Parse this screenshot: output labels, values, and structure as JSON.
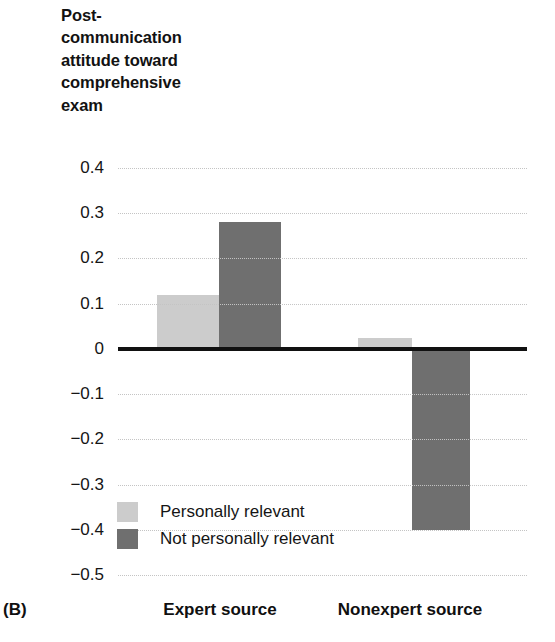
{
  "panel": {
    "label": "(B)"
  },
  "chart_data": {
    "type": "bar",
    "title": "Post-\ncommunication\nattitude toward\ncomprehensive\nexam",
    "xlabel": "",
    "ylabel": "",
    "ylim": [
      -0.5,
      0.4
    ],
    "ytick_step": 0.1,
    "grid": true,
    "zero_line": true,
    "legend_position": "inside-lower-left",
    "categories": [
      "Expert source",
      "Nonexpert source"
    ],
    "yticks": [
      "0.4",
      "0.3",
      "0.2",
      "0.1",
      "0",
      "−0.1",
      "−0.2",
      "−0.3",
      "−0.4",
      "−0.5"
    ],
    "ytick_values": [
      0.4,
      0.3,
      0.2,
      0.1,
      0,
      -0.1,
      -0.2,
      -0.3,
      -0.4,
      -0.5
    ],
    "series": [
      {
        "name": "Personally relevant",
        "color": "#cccccc",
        "values": [
          0.12,
          0.025
        ]
      },
      {
        "name": "Not personally relevant",
        "color": "#6f6f6f",
        "values": [
          0.28,
          -0.4
        ]
      }
    ]
  }
}
